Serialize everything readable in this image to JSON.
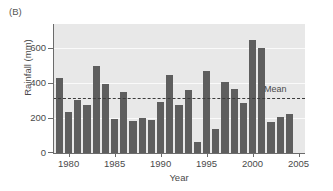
{
  "panel": {
    "label": "(B)"
  },
  "chart_data": {
    "type": "bar",
    "title": "",
    "xlabel": "Year",
    "ylabel": "Rainfall (mm)",
    "xlim": [
      1978.3,
      2005.7
    ],
    "ylim": [
      0,
      700
    ],
    "yticks": [
      0,
      200,
      400,
      600
    ],
    "ytick_labels": [
      "0",
      "200",
      "400",
      "600"
    ],
    "xticks": [
      1980,
      1985,
      1990,
      1995,
      2000,
      2005
    ],
    "xtick_labels": [
      "1980",
      "1985",
      "1990",
      "1995",
      "2000",
      "2005"
    ],
    "grid": "horizontal-white",
    "legend_position": "none",
    "bar_color": "#5e5e5e",
    "plot_background": "#e8e8e8",
    "gridline_color": "#fafafa",
    "axis_color": "#6b6b6b",
    "categories": [
      1979,
      1980,
      1981,
      1982,
      1983,
      1984,
      1985,
      1986,
      1987,
      1988,
      1989,
      1990,
      1991,
      1992,
      1993,
      1994,
      1995,
      1996,
      1997,
      1998,
      1999,
      2000,
      2001,
      2002,
      2003,
      2004,
      2005
    ],
    "values": [
      405,
      225,
      288,
      262,
      472,
      375,
      183,
      332,
      173,
      188,
      180,
      278,
      425,
      260,
      342,
      58,
      443,
      131,
      383,
      350,
      272,
      613,
      568,
      168,
      198,
      210,
      0
    ],
    "annotations": [
      {
        "name": "mean-line",
        "type": "hline",
        "value": 300,
        "style": "dashed",
        "label": "Mean",
        "color": "#3b3b3b"
      }
    ]
  }
}
